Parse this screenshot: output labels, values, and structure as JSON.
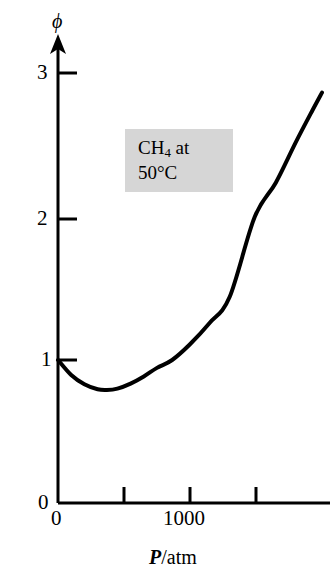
{
  "chart_data": {
    "type": "line",
    "title": "",
    "subtitle": "",
    "xlabel": "P/atm",
    "xlabel_parts": {
      "variable": "P",
      "separator": "/",
      "unit": "atm"
    },
    "ylabel": "ϕ",
    "xlim": [
      0,
      2070
    ],
    "ylim": [
      0,
      3.5
    ],
    "xticks": [
      0,
      500,
      1000,
      1500
    ],
    "xtick_labels": [
      "0",
      "",
      "1000",
      ""
    ],
    "yticks": [
      0,
      1,
      2,
      3
    ],
    "ytick_labels": [
      "0",
      "1",
      "2",
      "3"
    ],
    "grid": false,
    "legend": "none",
    "axis_style": "open-left-bottom-with-y-arrow",
    "series": [
      {
        "name": "CH4 fugacity coefficient at 50 C",
        "color": "#000000",
        "line_width": 4,
        "x": [
          0,
          100,
          200,
          300,
          370,
          450,
          550,
          650,
          750,
          865,
          1000,
          1150,
          1300,
          1490,
          1650,
          1800,
          1930,
          2000
        ],
        "y": [
          1.0,
          0.895,
          0.83,
          0.795,
          0.79,
          0.8,
          0.835,
          0.885,
          0.945,
          1.0,
          1.11,
          1.26,
          1.44,
          2.0,
          2.24,
          2.52,
          2.75,
          2.87
        ]
      }
    ],
    "annotations": [
      {
        "name": "sample-label",
        "line1_prefix": "CH",
        "line1_sub": "4",
        "line1_suffix": " at",
        "line2": "50°C",
        "background": "#d6d6d6"
      }
    ],
    "notable_points": {
      "initial_value_label": "1",
      "minimum_x": 370,
      "minimum_y": 0.79,
      "unity_crossing_x": 865,
      "final_x": 2000,
      "final_y": 2.87
    }
  },
  "axes": {
    "y_ticks": [
      {
        "label": "3",
        "value": 3
      },
      {
        "label": "2",
        "value": 2
      },
      {
        "label": "1",
        "value": 1
      },
      {
        "label": "0",
        "value": 0
      }
    ],
    "x_ticks": [
      {
        "label": "0",
        "value": 0
      },
      {
        "label": "1000",
        "value": 1000
      }
    ],
    "y_title": "ϕ",
    "x_title_variable": "P",
    "x_title_separator": "/",
    "x_title_unit": "atm"
  },
  "annotation": {
    "line1_prefix": "CH",
    "line1_sub": "4",
    "line1_suffix": " at",
    "line2": "50°C"
  },
  "colors": {
    "curve": "#000000",
    "axis": "#000000",
    "annotation_background": "#d6d6d6",
    "page_background": "#ffffff"
  }
}
